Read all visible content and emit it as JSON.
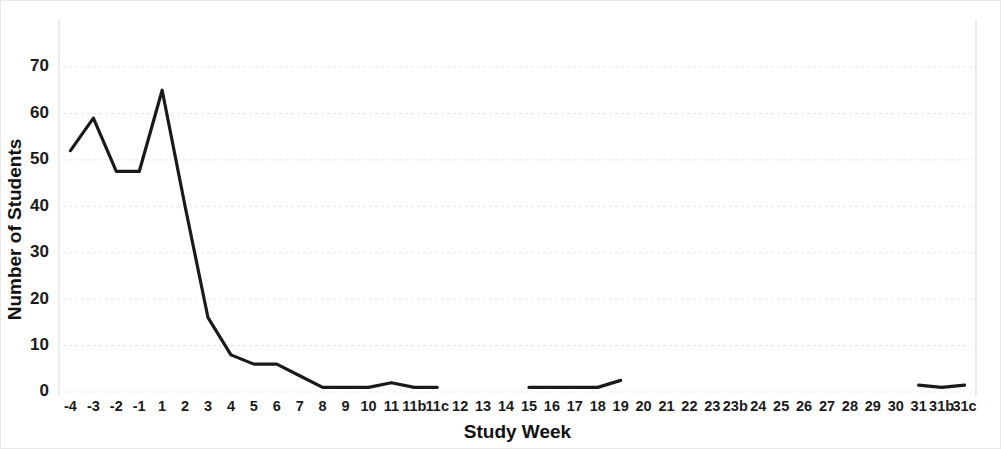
{
  "chart_data": {
    "type": "line",
    "title": "",
    "xlabel": "Study Week",
    "ylabel": "Number of Students",
    "ylim": [
      0,
      70
    ],
    "yticks": [
      0,
      10,
      20,
      30,
      40,
      50,
      60,
      70
    ],
    "grid": true,
    "legend": "none",
    "line_color": "#1a1a1a",
    "grid_color": "#e6e6e6",
    "categories": [
      "-4",
      "-3",
      "-2",
      "-1",
      "1",
      "2",
      "3",
      "4",
      "5",
      "6",
      "7",
      "8",
      "9",
      "10",
      "11",
      "11b",
      "11c",
      "12",
      "13",
      "14",
      "15",
      "16",
      "17",
      "18",
      "19",
      "20",
      "21",
      "22",
      "23",
      "23b",
      "24",
      "25",
      "26",
      "27",
      "28",
      "29",
      "30",
      "31",
      "31b",
      "31c"
    ],
    "series": [
      {
        "name": "Number of Students",
        "values": [
          52,
          59,
          47.5,
          47.5,
          65,
          40,
          16,
          8,
          6,
          6,
          3.5,
          1,
          1,
          1,
          2,
          1,
          1,
          null,
          null,
          null,
          1,
          1,
          1,
          1,
          2.5,
          null,
          null,
          null,
          null,
          null,
          null,
          null,
          null,
          null,
          null,
          null,
          null,
          1.5,
          1,
          1.5
        ]
      }
    ]
  }
}
